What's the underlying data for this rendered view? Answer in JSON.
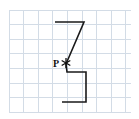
{
  "figure": {
    "canvas": {
      "width": 139,
      "height": 119,
      "background": "#ffffff"
    },
    "grid": {
      "color": "#d3dce6",
      "stroke_width": 1,
      "cell_size": 14.6,
      "x_start": 9,
      "y_start": 10,
      "x_end": 131,
      "y_end": 112,
      "columns": 8,
      "rows": 7,
      "x_lines": [
        9,
        23.6,
        38.2,
        52.8,
        67.4,
        82,
        96.6,
        111.2,
        125.8
      ],
      "y_lines": [
        10,
        24.6,
        39.2,
        53.8,
        68.4,
        83,
        97.6,
        112.2
      ]
    },
    "shapes": [
      {
        "name": "upper-triangle",
        "kind": "triangle",
        "stroke": "#1a1a1a",
        "stroke_width": 1.6,
        "fill": "none",
        "points": "55,22 84,22 66,64",
        "vertices": [
          {
            "label": "top-left",
            "x": 55,
            "y": 22
          },
          {
            "label": "top-right",
            "x": 84,
            "y": 22
          },
          {
            "label": "apex-at-P",
            "x": 66,
            "y": 64
          }
        ]
      },
      {
        "name": "lower-quadrilateral",
        "kind": "polygon",
        "stroke": "#1a1a1a",
        "stroke_width": 1.6,
        "fill": "none",
        "points": "66,64 67,72 86,72 86,102 62,102",
        "vertices": [
          {
            "label": "apex-at-P",
            "x": 66,
            "y": 64
          },
          {
            "label": "notch-left",
            "x": 67,
            "y": 72
          },
          {
            "label": "top-right",
            "x": 86,
            "y": 72
          },
          {
            "label": "bottom-right",
            "x": 86,
            "y": 102
          },
          {
            "label": "bottom-left",
            "x": 62,
            "y": 102
          }
        ]
      }
    ],
    "points": [
      {
        "name": "point-P",
        "label": "P",
        "x": 66,
        "y": 63,
        "marker": "asterisk-marker",
        "marker_color": "#111111",
        "marker_size": 5,
        "label_x": 53,
        "label_y": 67,
        "label_color": "#111111"
      }
    ]
  }
}
